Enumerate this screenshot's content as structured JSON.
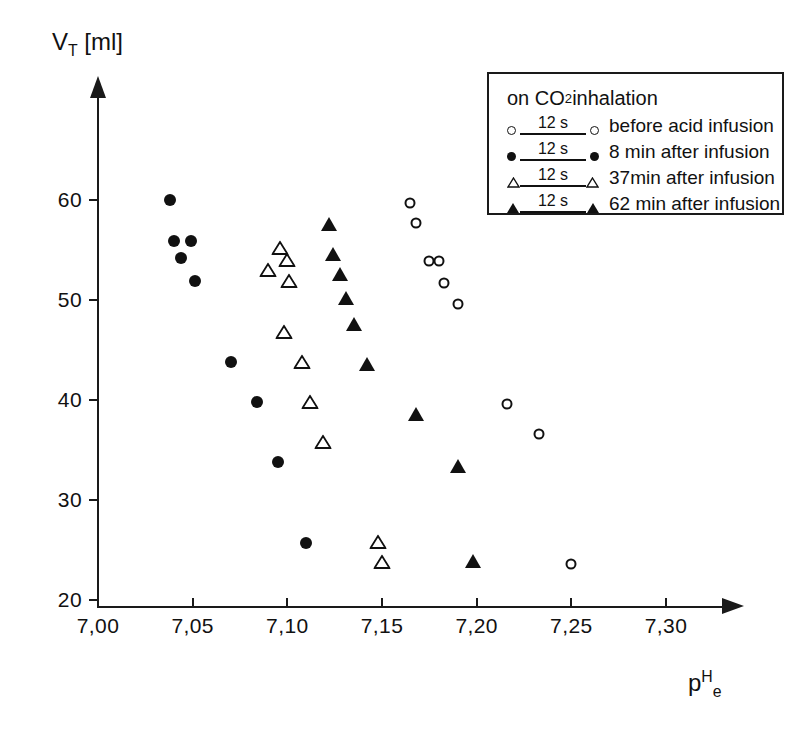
{
  "chart_data": {
    "type": "scatter",
    "title": "",
    "xlabel": "pHe",
    "ylabel": "VT [ml]",
    "xlim": [
      7.0,
      7.325
    ],
    "ylim": [
      20,
      64
    ],
    "grid": false,
    "x_ticks": [
      7.0,
      7.05,
      7.1,
      7.15,
      7.2,
      7.25,
      7.3
    ],
    "x_tick_labels": [
      "7,00",
      "7,05",
      "7,10",
      "7,15",
      "7,20",
      "7,25",
      "7,30"
    ],
    "y_ticks": [
      20,
      30,
      40,
      50,
      60
    ],
    "y_tick_labels": [
      "20",
      "30",
      "40",
      "50",
      "60"
    ],
    "legend_position": "top-right",
    "series": [
      {
        "name": "before acid infusion",
        "marker": "open-circle",
        "duration": "12 s",
        "points": [
          {
            "x": 7.165,
            "y": 59.7
          },
          {
            "x": 7.168,
            "y": 57.7
          },
          {
            "x": 7.175,
            "y": 53.9
          },
          {
            "x": 7.18,
            "y": 53.9
          },
          {
            "x": 7.183,
            "y": 51.7
          },
          {
            "x": 7.19,
            "y": 49.6
          },
          {
            "x": 7.216,
            "y": 39.6
          },
          {
            "x": 7.233,
            "y": 36.6
          },
          {
            "x": 7.25,
            "y": 23.6
          }
        ]
      },
      {
        "name": "8 min after infusion",
        "marker": "filled-circle",
        "duration": "12 s",
        "points": [
          {
            "x": 7.038,
            "y": 60.0
          },
          {
            "x": 7.04,
            "y": 55.9
          },
          {
            "x": 7.049,
            "y": 55.9
          },
          {
            "x": 7.044,
            "y": 54.2
          },
          {
            "x": 7.051,
            "y": 51.9
          },
          {
            "x": 7.07,
            "y": 43.8
          },
          {
            "x": 7.084,
            "y": 39.8
          },
          {
            "x": 7.095,
            "y": 33.8
          },
          {
            "x": 7.11,
            "y": 25.7
          }
        ]
      },
      {
        "name": "37min after infusion",
        "marker": "open-triangle",
        "duration": "12 s",
        "points": [
          {
            "x": 7.096,
            "y": 55.2
          },
          {
            "x": 7.1,
            "y": 54.0
          },
          {
            "x": 7.09,
            "y": 53.0
          },
          {
            "x": 7.101,
            "y": 51.9
          },
          {
            "x": 7.098,
            "y": 46.8
          },
          {
            "x": 7.108,
            "y": 43.8
          },
          {
            "x": 7.112,
            "y": 39.8
          },
          {
            "x": 7.119,
            "y": 35.8
          },
          {
            "x": 7.148,
            "y": 25.8
          },
          {
            "x": 7.15,
            "y": 23.8
          }
        ]
      },
      {
        "name": "62 min after infusion",
        "marker": "filled-triangle",
        "duration": "12 s",
        "points": [
          {
            "x": 7.122,
            "y": 57.8
          },
          {
            "x": 7.124,
            "y": 54.8
          },
          {
            "x": 7.128,
            "y": 52.8
          },
          {
            "x": 7.131,
            "y": 50.4
          },
          {
            "x": 7.135,
            "y": 47.8
          },
          {
            "x": 7.142,
            "y": 43.8
          },
          {
            "x": 7.168,
            "y": 38.8
          },
          {
            "x": 7.19,
            "y": 33.6
          },
          {
            "x": 7.198,
            "y": 24.1
          }
        ]
      }
    ]
  },
  "axes": {
    "y_title_main": "V",
    "y_title_sub": "T",
    "y_title_unit": " [ml]",
    "x_title_main": "p",
    "x_title_sup": "H",
    "x_title_sub": "e"
  },
  "legend": {
    "title": "on CO2 inhalation",
    "title_main": "on CO",
    "title_sub": "2",
    "title_tail": " inhalation",
    "entries": [
      {
        "duration": "12 s",
        "label": "before acid infusion",
        "marker": "open-circle"
      },
      {
        "duration": "12 s",
        "label": "8 min after infusion",
        "marker": "filled-circle"
      },
      {
        "duration": "12 s",
        "label": "37min after infusion",
        "marker": "open-triangle"
      },
      {
        "duration": "12 s",
        "label": "62 min after infusion",
        "marker": "filled-triangle"
      }
    ]
  },
  "colors": {
    "ink": "#111111",
    "axis": "#1a1a1a",
    "background": "#ffffff"
  }
}
